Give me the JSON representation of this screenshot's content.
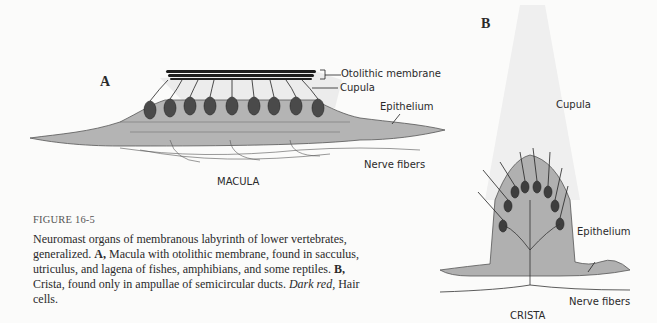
{
  "figure": {
    "number_label": "FIGURE 16-5",
    "caption": {
      "intro": "Neuromast organs of membranous labyrinth of lower vertebrates, generalized. ",
      "a_label": "A,",
      "a_text": " Macula with otolithic membrane, found in sacculus, utriculus, and lagena of fishes, amphibians, and some reptiles. ",
      "b_label": "B,",
      "b_text": " Crista, found only in ampullae of semicircular ducts. ",
      "dark_red_label": "Dark red,",
      "dark_red_text": " Hair cells."
    }
  },
  "panel_a": {
    "letter": "A",
    "title": "MACULA",
    "labels": {
      "otolithic_membrane": "Otolithic membrane",
      "cupula": "Cupula",
      "epithelium": "Epithelium",
      "nerve_fibers": "Nerve fibers"
    }
  },
  "panel_b": {
    "letter": "B",
    "title": "CRISTA",
    "labels": {
      "cupula": "Cupula",
      "epithelium": "Epithelium",
      "nerve_fibers": "Nerve fibers"
    }
  },
  "colors": {
    "background": "#fbfbfa",
    "supporting_cells": "#a9a9a9",
    "hair_cells": "#4a4a4a",
    "cupula": "#ececec",
    "otoliths": "#1e1e1e"
  }
}
